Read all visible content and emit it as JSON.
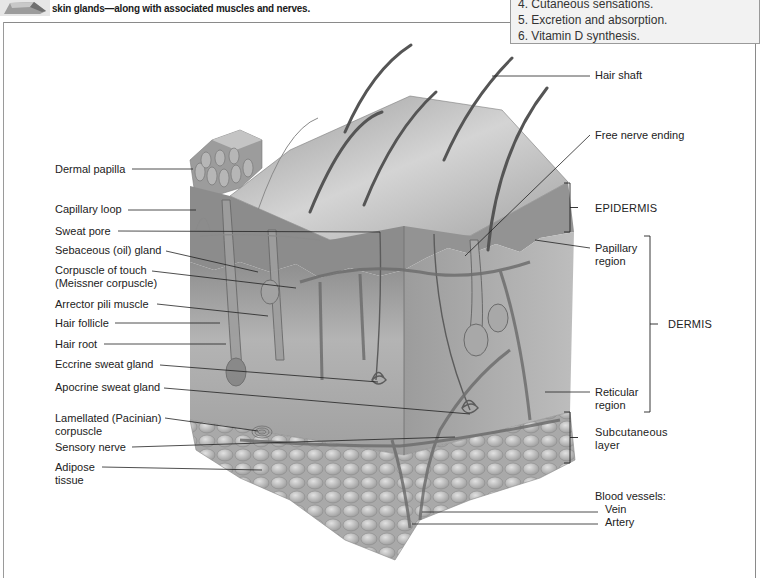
{
  "caption": {
    "icon": "skin-block-thumbnail-icon",
    "text": "skin glands—along with associated muscles and nerves."
  },
  "functions_box": {
    "items": [
      {
        "label": "4. Cutaneous sensations.",
        "y": 4
      },
      {
        "label": "5. Excretion and absorption.",
        "y": 20
      },
      {
        "label": "6. Vitamin D synthesis.",
        "y": 36
      }
    ]
  },
  "colors": {
    "line": "#222222",
    "skin_dark": "#7a7a7a",
    "skin_mid": "#a8a8a8",
    "skin_light": "#cfcfcf",
    "fat": "#bdbdbd",
    "box_bg": "#f2f2f2"
  },
  "left_labels": [
    {
      "id": "dermal-papilla",
      "lines": [
        "Dermal papilla"
      ],
      "x": 55,
      "y": 163,
      "lx1": 132,
      "ly1": 169,
      "lx2": 193,
      "ly2": 169
    },
    {
      "id": "capillary-loop",
      "lines": [
        "Capillary loop"
      ],
      "x": 55,
      "y": 203,
      "lx1": 128,
      "ly1": 210,
      "lx2": 196,
      "ly2": 210
    },
    {
      "id": "sweat-pore",
      "lines": [
        "Sweat pore"
      ],
      "x": 55,
      "y": 225,
      "lx1": 118,
      "ly1": 231,
      "lx2": 380,
      "ly2": 232
    },
    {
      "id": "sebaceous-gland",
      "lines": [
        "Sebaceous (oil) gland"
      ],
      "x": 55,
      "y": 244,
      "lx1": 166,
      "ly1": 251,
      "lx2": 258,
      "ly2": 272
    },
    {
      "id": "corpuscle-of-touch",
      "lines": [
        "Corpuscle of touch",
        "(Meissner corpuscle)"
      ],
      "x": 55,
      "y": 264,
      "lx1": 152,
      "ly1": 271,
      "lx2": 296,
      "ly2": 288
    },
    {
      "id": "arrector-pili-muscle",
      "lines": [
        "Arrector pili muscle"
      ],
      "x": 55,
      "y": 298,
      "lx1": 157,
      "ly1": 304,
      "lx2": 268,
      "ly2": 316
    },
    {
      "id": "hair-follicle",
      "lines": [
        "Hair follicle"
      ],
      "x": 55,
      "y": 317,
      "lx1": 115,
      "ly1": 323,
      "lx2": 220,
      "ly2": 323
    },
    {
      "id": "hair-root",
      "lines": [
        "Hair root"
      ],
      "x": 55,
      "y": 338,
      "lx1": 104,
      "ly1": 344,
      "lx2": 226,
      "ly2": 344
    },
    {
      "id": "eccrine-sweat-gland",
      "lines": [
        "Eccrine sweat gland"
      ],
      "x": 55,
      "y": 358,
      "lx1": 160,
      "ly1": 365,
      "lx2": 378,
      "ly2": 382
    },
    {
      "id": "apocrine-sweat-gland",
      "lines": [
        "Apocrine sweat gland"
      ],
      "x": 55,
      "y": 381,
      "lx1": 164,
      "ly1": 388,
      "lx2": 470,
      "ly2": 414
    },
    {
      "id": "lamellated-corpuscle",
      "lines": [
        "Lamellated (Pacinian)",
        "corpuscle"
      ],
      "x": 55,
      "y": 412,
      "lx1": 165,
      "ly1": 418,
      "lx2": 258,
      "ly2": 431
    },
    {
      "id": "sensory-nerve",
      "lines": [
        "Sensory nerve"
      ],
      "x": 55,
      "y": 441,
      "lx1": 132,
      "ly1": 447,
      "lx2": 455,
      "ly2": 437
    },
    {
      "id": "adipose-tissue",
      "lines": [
        "Adipose",
        "tissue"
      ],
      "x": 55,
      "y": 461,
      "lx1": 102,
      "ly1": 467,
      "lx2": 262,
      "ly2": 470
    }
  ],
  "right_labels": [
    {
      "id": "hair-shaft",
      "lines": [
        "Hair shaft"
      ],
      "x": 595,
      "y": 69,
      "lx1": 492,
      "ly1": 76,
      "lx2": 590,
      "ly2": 76
    },
    {
      "id": "free-nerve-ending",
      "lines": [
        "Free nerve ending"
      ],
      "x": 595,
      "y": 129,
      "lx1": 465,
      "ly1": 256,
      "lx2": 590,
      "ly2": 135
    },
    {
      "id": "papillary-region",
      "lines": [
        "Papillary",
        "region"
      ],
      "x": 595,
      "y": 242,
      "lx1": 535,
      "ly1": 240,
      "lx2": 590,
      "ly2": 248
    },
    {
      "id": "reticular-region",
      "lines": [
        "Reticular",
        "region"
      ],
      "x": 595,
      "y": 386,
      "lx1": 545,
      "ly1": 392,
      "lx2": 590,
      "ly2": 392
    },
    {
      "id": "blood-vessels",
      "lines": [
        "Blood vessels:"
      ],
      "x": 595,
      "y": 490,
      "lx1": 0,
      "ly1": 0,
      "lx2": 0,
      "ly2": 0
    },
    {
      "id": "vein",
      "lines": [
        "Vein"
      ],
      "x": 605,
      "y": 503,
      "lx1": 422,
      "ly1": 512,
      "lx2": 598,
      "ly2": 512
    },
    {
      "id": "artery",
      "lines": [
        "Artery"
      ],
      "x": 605,
      "y": 516,
      "lx1": 412,
      "ly1": 524,
      "lx2": 598,
      "ly2": 524
    }
  ],
  "brackets": [
    {
      "id": "epidermis",
      "label": "EPIDERMIS",
      "x": 570,
      "y1": 183,
      "y2": 232,
      "lx": 595,
      "ly": 200
    },
    {
      "id": "dermis",
      "label": "DERMIS",
      "x": 650,
      "y1": 236,
      "y2": 412,
      "lx": 668,
      "ly": 318
    },
    {
      "id": "subcutaneous",
      "label": "Subcutaneous",
      "label2": "layer",
      "x": 570,
      "y1": 412,
      "y2": 463,
      "lx": 595,
      "ly": 430
    }
  ]
}
